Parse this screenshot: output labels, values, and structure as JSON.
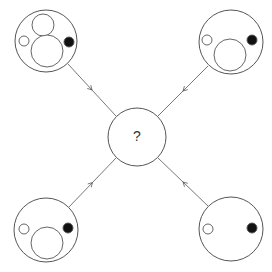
{
  "center": {
    "label": "?",
    "cx": 137,
    "cy": 137,
    "r": 29
  },
  "stroke_color": "#555555",
  "fill_black": "#111111",
  "panels": [
    {
      "id": "top-left",
      "outer": {
        "cx": 46,
        "cy": 41,
        "r": 31
      },
      "open_circles": [
        {
          "cx": 43,
          "cy": 25,
          "r": 11
        },
        {
          "cx": 47,
          "cy": 51,
          "r": 16
        },
        {
          "cx": 24,
          "cy": 41,
          "r": 5
        }
      ],
      "black_dots": [
        {
          "cx": 69,
          "cy": 42,
          "r": 5
        }
      ],
      "arrow": {
        "x1": 68,
        "y1": 64,
        "x2": 116,
        "y2": 116,
        "head_at": 0.5
      }
    },
    {
      "id": "top-right",
      "outer": {
        "cx": 231,
        "cy": 42,
        "r": 32
      },
      "open_circles": [
        {
          "cx": 207,
          "cy": 40,
          "r": 5
        },
        {
          "cx": 230,
          "cy": 55,
          "r": 16
        }
      ],
      "black_dots": [
        {
          "cx": 252,
          "cy": 40,
          "r": 5
        }
      ],
      "arrow": {
        "x1": 208,
        "y1": 66,
        "x2": 158,
        "y2": 116,
        "head_at": 0.5
      }
    },
    {
      "id": "bottom-left",
      "outer": {
        "cx": 46,
        "cy": 230,
        "r": 32
      },
      "open_circles": [
        {
          "cx": 24,
          "cy": 229,
          "r": 5
        },
        {
          "cx": 47,
          "cy": 243,
          "r": 16
        }
      ],
      "black_dots": [
        {
          "cx": 68,
          "cy": 228,
          "r": 5
        }
      ],
      "arrow": {
        "x1": 69,
        "y1": 207,
        "x2": 116,
        "y2": 158,
        "head_at": 0.5
      }
    },
    {
      "id": "bottom-right",
      "outer": {
        "cx": 231,
        "cy": 229,
        "r": 32
      },
      "open_circles": [
        {
          "cx": 208,
          "cy": 229,
          "r": 5
        }
      ],
      "black_dots": [
        {
          "cx": 252,
          "cy": 228,
          "r": 5
        }
      ],
      "arrow": {
        "x1": 208,
        "y1": 206,
        "x2": 158,
        "y2": 158,
        "head_at": 0.5
      }
    }
  ]
}
